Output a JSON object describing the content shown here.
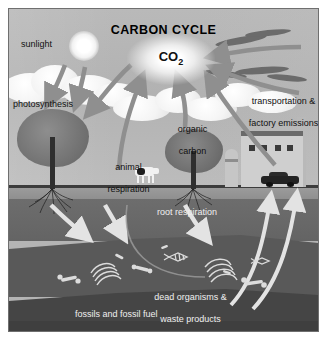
{
  "diagram": {
    "title": "CARBON CYCLE",
    "center_label": "CO",
    "center_label_sub": "2",
    "type": "cycle-diagram",
    "style": "grayscale scientific illustration"
  },
  "labels": {
    "sunlight": "sunlight",
    "photosynthesis": "photosynthesis",
    "animal_respiration_line1": "animal",
    "animal_respiration_line2": "respiration",
    "organic_carbon_line1": "organic",
    "organic_carbon_line2": "carbon",
    "transportation_line1": "transportation &",
    "transportation_line2": "factory emissions",
    "root_respiration": "root respiration",
    "dead_organisms_line1": "dead organisms &",
    "dead_organisms_line2": "waste products",
    "fossils": "fossils and fossil fuel"
  },
  "scene_elements": {
    "sun": "sun",
    "clouds": "clouds",
    "tree_left": "deciduous-tree",
    "tree_right": "deciduous-tree",
    "cow": "cow",
    "factory": "factory-building",
    "silo": "storage-silo",
    "smokestack": "smokestack",
    "car": "automobile",
    "smoke_plumes": "emission-smoke",
    "roots": "tree-roots",
    "fossils": "buried-bones-and-fossils"
  },
  "flows": [
    {
      "name": "sunlight-to-plants",
      "from": "sun",
      "to": "tree-left",
      "direction": "down"
    },
    {
      "name": "photosynthesis-uptake",
      "from": "CO2",
      "to": "tree-left",
      "direction": "down-left"
    },
    {
      "name": "animal-respiration-release",
      "from": "animal",
      "to": "CO2",
      "direction": "up"
    },
    {
      "name": "organic-carbon-release",
      "from": "organic-carbon",
      "to": "CO2",
      "direction": "up"
    },
    {
      "name": "factory-emissions",
      "from": "factory",
      "to": "CO2",
      "direction": "up-left"
    },
    {
      "name": "transportation-emissions",
      "from": "car",
      "to": "CO2",
      "direction": "up-left"
    },
    {
      "name": "organic-matter-burial",
      "from": "surface",
      "to": "soil",
      "direction": "down"
    },
    {
      "name": "fossil-fuel-extraction",
      "from": "fossil-layer",
      "to": "surface",
      "direction": "up"
    }
  ],
  "layers": {
    "sky": "sky",
    "topsoil": "topsoil",
    "subsoil": "subsoil",
    "fossil_layer": "fossil-fuel-layer"
  },
  "colors": {
    "sky": "#b4b4b4",
    "soil_top": "#9c9c9c",
    "soil_mid": "#6d6d6d",
    "soil_deep": "#595959",
    "fossil_layer": "#454545",
    "arrow_gray": "#8f8f8f",
    "arrow_white": "#e8e8e8",
    "text_dark": "#111111",
    "text_light": "#f0f0f0"
  }
}
